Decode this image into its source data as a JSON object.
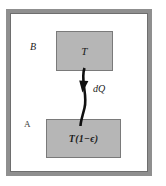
{
  "figure": {
    "background_color": "#ffffff",
    "frame": {
      "name": "outer-enclosure",
      "border_color": "#8f8f8f",
      "fill_color": "#ffffff"
    },
    "blocks": [
      {
        "id": "hot",
        "label": "T",
        "fill_color": "#b6b6b6",
        "border_color": "#7a7a7a"
      },
      {
        "id": "cold",
        "label": "T(1−ϵ)",
        "fill_color": "#b6b6b6",
        "border_color": "#7a7a7a"
      }
    ],
    "region_labels": [
      {
        "id": "b",
        "label": "B"
      },
      {
        "id": "a",
        "label": "A"
      }
    ],
    "arrow": {
      "label": "dQ",
      "color": "#101010",
      "direction": "downward",
      "from": "hot",
      "to": "cold"
    }
  }
}
